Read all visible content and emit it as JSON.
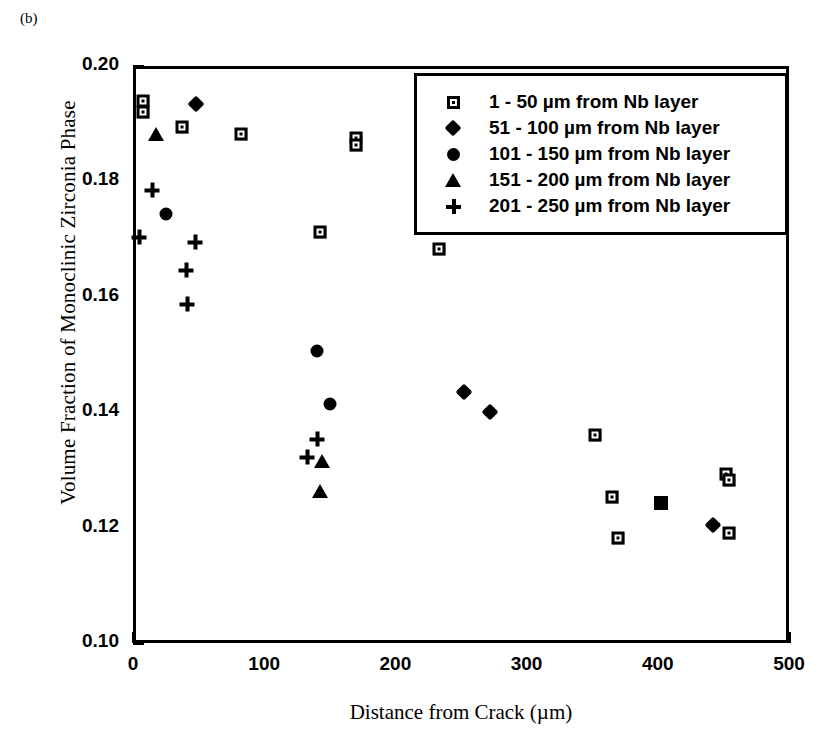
{
  "panel_label": "(b)",
  "chart_data": {
    "type": "scatter",
    "title": "",
    "xlabel": "Distance from Crack (µm)",
    "ylabel": "Volume Fraction of Monoclinic Zirconia Phase",
    "xlim": [
      0,
      500
    ],
    "ylim": [
      0.1,
      0.2
    ],
    "xticks": [
      0,
      100,
      200,
      300,
      400,
      500
    ],
    "xtick_labels": [
      "0",
      "100",
      "200",
      "300",
      "400",
      "500"
    ],
    "xminor_ticks": [
      50,
      150,
      250,
      350,
      450
    ],
    "yticks": [
      0.1,
      0.12,
      0.14,
      0.16,
      0.18,
      0.2
    ],
    "ytick_labels": [
      "0.10",
      "0.12",
      "0.14",
      "0.16",
      "0.18",
      "0.20"
    ],
    "yminor_ticks": [
      0.11,
      0.13,
      0.15,
      0.17,
      0.19
    ],
    "grid": false,
    "legend_position": "upper right",
    "series": [
      {
        "name": "1 - 50 µm from Nb layer",
        "marker": "open-square",
        "points": [
          {
            "x": 5,
            "y": 0.1945
          },
          {
            "x": 5,
            "y": 0.1925
          },
          {
            "x": 35,
            "y": 0.19
          },
          {
            "x": 80,
            "y": 0.1888
          },
          {
            "x": 168,
            "y": 0.188
          },
          {
            "x": 168,
            "y": 0.1868
          },
          {
            "x": 140,
            "y": 0.1718
          },
          {
            "x": 231,
            "y": 0.1688
          },
          {
            "x": 350,
            "y": 0.1365
          },
          {
            "x": 363,
            "y": 0.1258
          },
          {
            "x": 367,
            "y": 0.1188
          },
          {
            "x": 450,
            "y": 0.1298
          },
          {
            "x": 452,
            "y": 0.1288
          },
          {
            "x": 452,
            "y": 0.1195
          }
        ]
      },
      {
        "name": "51 - 100 µm from Nb layer",
        "marker": "filled-diamond",
        "points": [
          {
            "x": 46,
            "y": 0.194
          },
          {
            "x": 250,
            "y": 0.144
          },
          {
            "x": 270,
            "y": 0.1405
          },
          {
            "x": 440,
            "y": 0.121
          }
        ]
      },
      {
        "name": "101 - 150 µm from Nb layer",
        "marker": "filled-circle",
        "points": [
          {
            "x": 23,
            "y": 0.1748
          },
          {
            "x": 138,
            "y": 0.1512
          },
          {
            "x": 148,
            "y": 0.142
          }
        ]
      },
      {
        "name": "151 - 200 µm from Nb layer",
        "marker": "filled-triangle",
        "points": [
          {
            "x": 15,
            "y": 0.1888
          },
          {
            "x": 142,
            "y": 0.132
          },
          {
            "x": 140,
            "y": 0.1268
          }
        ]
      },
      {
        "name": "201 - 250 µm from Nb layer",
        "marker": "plus",
        "points": [
          {
            "x": 12,
            "y": 0.179
          },
          {
            "x": 2,
            "y": 0.1708
          },
          {
            "x": 45,
            "y": 0.17
          },
          {
            "x": 38,
            "y": 0.1652
          },
          {
            "x": 39,
            "y": 0.1592
          },
          {
            "x": 138,
            "y": 0.1358
          },
          {
            "x": 130,
            "y": 0.1328
          }
        ]
      },
      {
        "name": "",
        "marker": "filled-square",
        "points": [
          {
            "x": 400,
            "y": 0.1248
          }
        ]
      }
    ]
  }
}
